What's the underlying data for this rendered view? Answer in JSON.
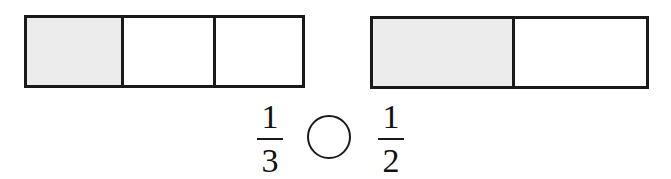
{
  "diagram": {
    "colors": {
      "shaded": "#ececec",
      "unshaded": "#ffffff",
      "stroke": "#1a1a1a"
    },
    "left_bar": {
      "parts": 3,
      "shaded_parts": 1,
      "cells": [
        {
          "shaded": true
        },
        {
          "shaded": false
        },
        {
          "shaded": false
        }
      ]
    },
    "right_bar": {
      "parts": 2,
      "shaded_parts": 1,
      "cells": [
        {
          "shaded": true
        },
        {
          "shaded": false
        }
      ]
    },
    "left_fraction": {
      "numerator": "1",
      "denominator": "3"
    },
    "comparison_blank": "",
    "right_fraction": {
      "numerator": "1",
      "denominator": "2"
    }
  }
}
